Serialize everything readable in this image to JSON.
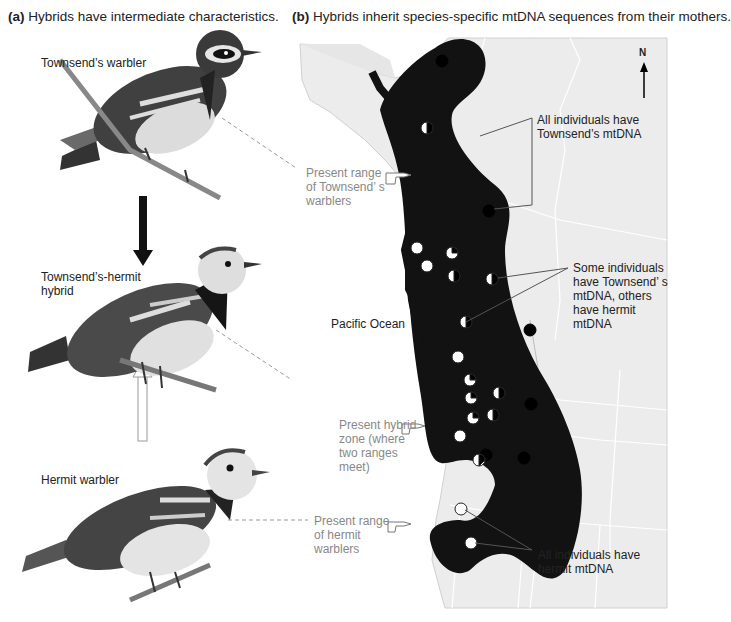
{
  "panel_a": {
    "heading_letter": "(a)",
    "heading_text": " Hybrids have intermediate characteristics.",
    "birds": [
      {
        "label": "Townsend’s warbler"
      },
      {
        "label_line1": "Townsend’s-hermit",
        "label_line2": "hybrid"
      },
      {
        "label": "Hermit warbler"
      }
    ],
    "callouts": [
      {
        "lines": [
          "Present range",
          "of Townsend’ s",
          "warblers"
        ]
      },
      {
        "lines": [
          "Present hybrid",
          "zone (where",
          "two ranges",
          "meet)"
        ]
      },
      {
        "lines": [
          "Present range",
          "of hermit",
          "warblers"
        ]
      }
    ],
    "arrows": [
      {
        "name": "down-arrow",
        "style": "solid-black",
        "direction": "down"
      },
      {
        "name": "up-arrow",
        "style": "hollow-white",
        "direction": "up"
      }
    ]
  },
  "panel_b": {
    "heading_letter": "(b)",
    "heading_text": " Hybrids inherit species-specific mtDNA sequences from their mothers.",
    "compass": "N",
    "ocean_label": "Pacific Ocean",
    "annotations": [
      {
        "lines": [
          "All individuals have",
          "Townsend’s mtDNA"
        ]
      },
      {
        "lines": [
          "Some individuals",
          "have Townsend’ s",
          "mtDNA, others",
          "have hermit",
          "mtDNA"
        ]
      },
      {
        "lines": [
          "All individuals have",
          "hermit mtDNA"
        ]
      }
    ],
    "legend_semantics": {
      "black_circle": "Townsend’s mtDNA",
      "white_circle": "hermit mtDNA",
      "mixed_circle": "both mtDNA types"
    },
    "colors": {
      "range_fill": "#111111",
      "land": "#ececec",
      "border": "#ffffff",
      "callout_text": "#888888"
    }
  }
}
